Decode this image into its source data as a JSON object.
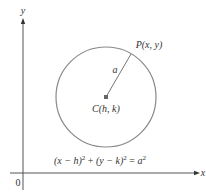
{
  "diagram": {
    "axes": {
      "x_label": "x",
      "y_label": "y",
      "origin_label": "0",
      "axis_color": "#555555"
    },
    "circle": {
      "center_label": "C(h, k)",
      "point_label": "P(x, y)",
      "radius_label": "a",
      "stroke_color": "#888888",
      "center_dot_color": "#666666"
    },
    "equation": {
      "lhs_part1": "(x − h)",
      "exp1": "2",
      "plus": " + ",
      "lhs_part2": "(y − k)",
      "exp2": "2",
      "equals": " = ",
      "rhs": "a",
      "exp3": "2"
    }
  }
}
